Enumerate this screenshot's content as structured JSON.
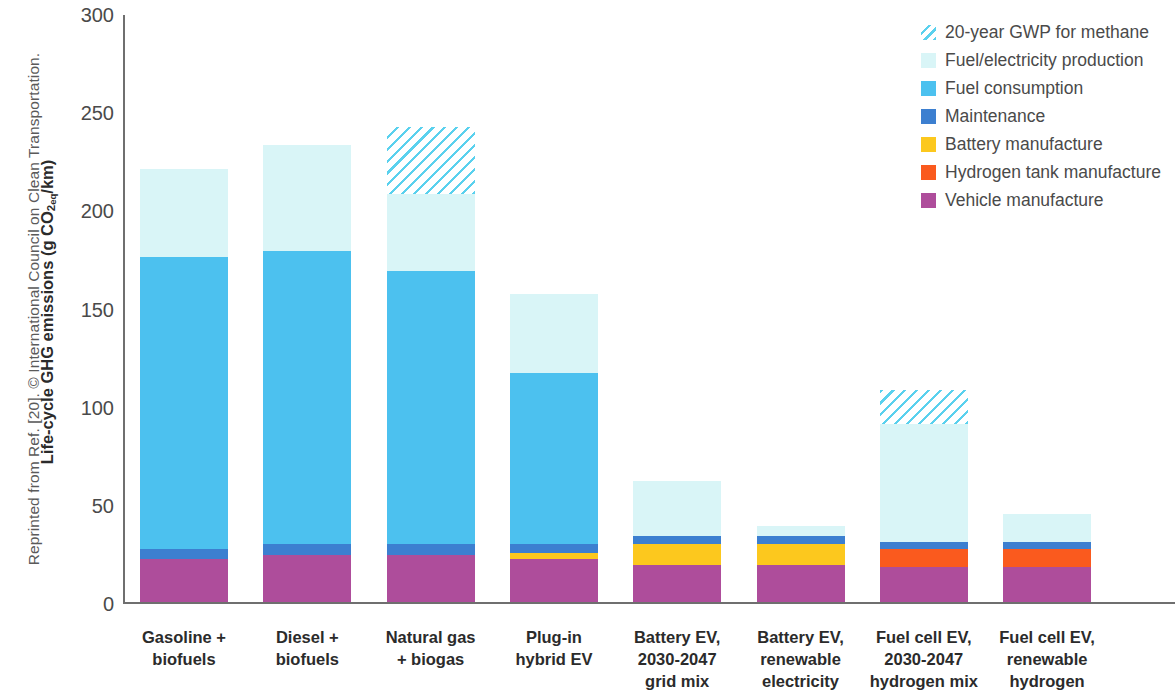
{
  "credit": "Reprinted from Ref. [20]. © International Council on Clean Transportation.",
  "chart_data": {
    "type": "bar",
    "stacked": true,
    "title": "",
    "xlabel": "",
    "ylabel": "Life-cycle GHG emissions (g CO2 eq/km)",
    "ylabel_parts": {
      "pre": "Life-cycle GHG emissions (g CO",
      "sub": "2",
      "eq": "eq",
      "post": "/km)"
    },
    "ylim": [
      0,
      300
    ],
    "yticks": [
      0,
      50,
      100,
      150,
      200,
      250,
      300
    ],
    "grid": false,
    "legend_position": "top-right",
    "categories": [
      "Gasoline + biofuels",
      "Diesel + biofuels",
      "Natural gas + biogas",
      "Plug-in hybrid EV",
      "Battery EV, 2030-2047 grid mix",
      "Battery EV, renewable electricity",
      "Fuel cell EV, 2030-2047 hydrogen mix",
      "Fuel cell EV, renewable hydrogen"
    ],
    "category_lines": [
      [
        "Gasoline +",
        "biofuels"
      ],
      [
        "Diesel +",
        "biofuels"
      ],
      [
        "Natural gas",
        "+ biogas"
      ],
      [
        "Plug-in",
        "hybrid EV"
      ],
      [
        "Battery EV,",
        "2030-2047",
        "grid mix"
      ],
      [
        "Battery EV,",
        "renewable",
        "electricity"
      ],
      [
        "Fuel cell EV,",
        "2030-2047",
        "hydrogen mix"
      ],
      [
        "Fuel cell EV,",
        "renewable",
        "hydrogen"
      ]
    ],
    "series": [
      {
        "name": "Vehicle manufacture",
        "key": "veh",
        "color": "#ae4d9b",
        "values": [
          22,
          24,
          24,
          22,
          19,
          19,
          18,
          18
        ]
      },
      {
        "name": "Hydrogen tank manufacture",
        "key": "h2",
        "color": "#fa5a1e",
        "values": [
          0,
          0,
          0,
          0,
          0,
          0,
          9,
          9
        ]
      },
      {
        "name": "Battery manufacture",
        "key": "batt",
        "color": "#fcc81e",
        "values": [
          0,
          0,
          0,
          3,
          11,
          11,
          0,
          0
        ]
      },
      {
        "name": "Maintenance",
        "key": "maint",
        "color": "#3c7fd0",
        "values": [
          5,
          6,
          6,
          5,
          4,
          4,
          4,
          4
        ]
      },
      {
        "name": "Fuel consumption",
        "key": "fuel",
        "color": "#4cc1ef",
        "values": [
          149,
          149,
          139,
          87,
          0,
          0,
          0,
          0
        ]
      },
      {
        "name": "Fuel/electricity production",
        "key": "prod",
        "color": "#d9f5f7",
        "values": [
          45,
          54,
          39,
          40,
          28,
          5,
          60,
          14
        ]
      },
      {
        "name": "20-year GWP for methane",
        "key": "gwp",
        "color": "#5ad1ee",
        "values": [
          0,
          0,
          34,
          0,
          0,
          0,
          17,
          0
        ]
      }
    ],
    "totals": [
      221,
      233,
      242,
      157,
      62,
      39,
      108,
      45
    ],
    "legend": [
      {
        "label": "20-year GWP for methane",
        "color": "#5ad1ee",
        "hatched": true
      },
      {
        "label": "Fuel/electricity production",
        "color": "#d9f5f7",
        "hatched": false
      },
      {
        "label": "Fuel consumption",
        "color": "#4cc1ef",
        "hatched": false
      },
      {
        "label": "Maintenance",
        "color": "#3c7fd0",
        "hatched": false
      },
      {
        "label": "Battery manufacture",
        "color": "#fcc81e",
        "hatched": false
      },
      {
        "label": "Hydrogen tank manufacture",
        "color": "#fa5a1e",
        "hatched": false
      },
      {
        "label": "Vehicle manufacture",
        "color": "#ae4d9b",
        "hatched": false
      }
    ]
  }
}
